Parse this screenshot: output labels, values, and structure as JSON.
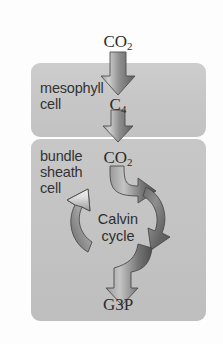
{
  "figure": {
    "background_color": "#fdfdfd"
  },
  "panels": {
    "mesophyll": {
      "label": "mesophyll\ncell",
      "fill_color": "#c6c6c6"
    },
    "bundle_sheath": {
      "label": "bundle\nsheath\ncell",
      "fill_color": "#c3c3c3"
    }
  },
  "molecules": {
    "co2_top": {
      "formula": "CO",
      "subscript": "2"
    },
    "c4": {
      "formula": "C",
      "subscript": "4"
    },
    "co2_mid": {
      "formula": "CO",
      "subscript": "2"
    },
    "g3p": {
      "formula": "G3P",
      "subscript": ""
    }
  },
  "cycle": {
    "label": "Calvin\ncycle"
  },
  "colors": {
    "arrow_dark": "#5a5a5a",
    "arrow_light": "#b4b4b4",
    "arrow_highlight": "#d5d5d5",
    "text": "#2e2e2e",
    "panel_light": "#cdcdcd",
    "panel_dark": "#bebebe"
  },
  "flow": {
    "steps": [
      "CO2 enters mesophyll cell",
      "CO2 is fixed into C4 compound",
      "C4 moves to bundle sheath cell",
      "CO2 released into Calvin cycle",
      "Calvin cycle produces G3P"
    ]
  }
}
